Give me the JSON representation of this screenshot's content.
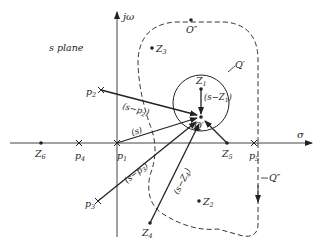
{
  "title": "s plane",
  "axes": {
    "vertical": "jω",
    "horizontal": "σ"
  },
  "poles": [
    {
      "label": "p1",
      "text": "p",
      "sub": "1"
    },
    {
      "label": "p2",
      "text": "p",
      "sub": "2"
    },
    {
      "label": "p3",
      "text": "p",
      "sub": "3"
    },
    {
      "label": "p4",
      "text": "p",
      "sub": "4"
    },
    {
      "label": "p5",
      "text": "p",
      "sub": "5"
    }
  ],
  "zeros": [
    {
      "label": "Z1",
      "text": "Z",
      "sub": "1"
    },
    {
      "label": "Z2",
      "text": "Z",
      "sub": "2"
    },
    {
      "label": "Z3",
      "text": "Z",
      "sub": "3"
    },
    {
      "label": "Z4",
      "text": "Z",
      "sub": "4"
    },
    {
      "label": "Z5",
      "text": "Z",
      "sub": "5"
    },
    {
      "label": "Z6",
      "text": "Z",
      "sub": "6"
    }
  ],
  "points": {
    "O_double_prime": "O″",
    "Q_prime_point": "Q′",
    "Q_prime_contour": "Q′",
    "Q_double_prime": "Q″"
  },
  "vectors": {
    "s": "(s)",
    "s_minus_p2": {
      "pre": "(s−p",
      "sub": "2",
      "post": ")"
    },
    "s_minus_p3": {
      "pre": "(s−p",
      "sub": "3",
      "post": ")"
    },
    "s_minus_Z1": {
      "pre": "(s−Z",
      "sub": "1",
      "post": ")"
    },
    "s_minus_Z4": {
      "pre": "(s−Z",
      "sub": "4",
      "post": ")"
    }
  },
  "colors": {
    "ink": "#222222",
    "background": "#ffffff"
  }
}
